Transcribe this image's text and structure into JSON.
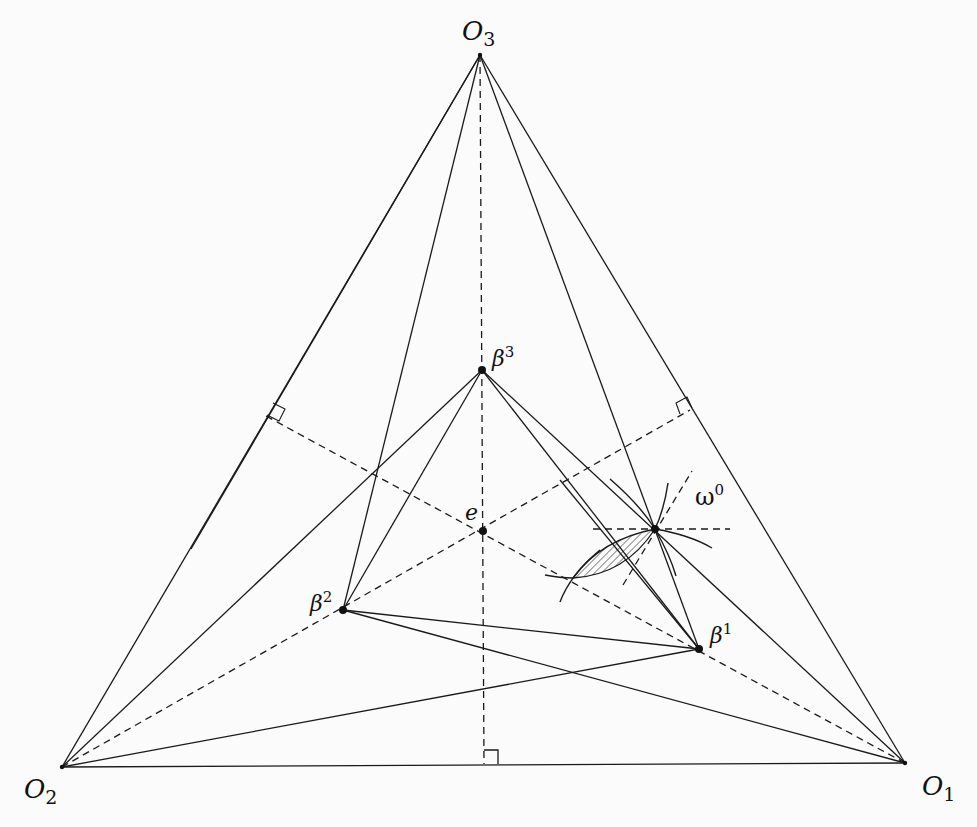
{
  "figure": {
    "type": "geometric-diagram",
    "vertices": {
      "O1": {
        "base": "O",
        "sub": "1",
        "x": 905,
        "y": 763
      },
      "O2": {
        "base": "O",
        "sub": "2",
        "x": 62,
        "y": 767
      },
      "O3": {
        "base": "O",
        "sub": "3",
        "x": 480,
        "y": 55
      }
    },
    "points": {
      "e": {
        "label": "e",
        "x": 483,
        "y": 531
      },
      "beta1": {
        "base": "β",
        "sup": "1",
        "x": 699,
        "y": 649
      },
      "beta2": {
        "base": "β",
        "sup": "2",
        "x": 343,
        "y": 610
      },
      "beta3": {
        "base": "β",
        "sup": "3",
        "x": 482,
        "y": 370
      },
      "omega0": {
        "base": "ω",
        "sup": "0",
        "x": 655,
        "y": 529
      }
    },
    "feet": {
      "bottom": {
        "x": 484,
        "y": 764
      },
      "left": {
        "x": 266,
        "y": 416
      },
      "right": {
        "x": 690,
        "y": 410
      }
    },
    "colors": {
      "ink": "#1a1a1a",
      "background": "#fbfbfb"
    }
  }
}
